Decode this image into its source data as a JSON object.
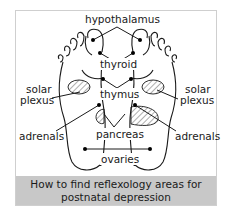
{
  "diagram": {
    "labels": {
      "hypothalamus": "hypothalamus",
      "thyroid": "thyroid",
      "thymus": "thymus",
      "solar_plexus_left_1": "solar",
      "solar_plexus_left_2": "plexus",
      "solar_plexus_right_1": "solar",
      "solar_plexus_right_2": "plexus",
      "adrenals_left": "adrenals",
      "adrenals_right": "adrenals",
      "pancreas": "pancreas",
      "ovaries": "ovaries"
    },
    "caption": {
      "line1": "How to find reflexology areas for",
      "line2": "postnatal depression"
    },
    "colors": {
      "caption_band": "#c8c8c8",
      "line": "#1a1a1a",
      "frame": "#cfcfcf"
    }
  }
}
